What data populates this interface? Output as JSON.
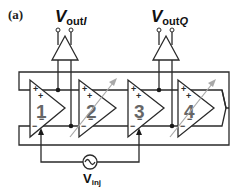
{
  "panel_label": "(a)",
  "outputs": {
    "i": {
      "main": "V",
      "sub": "out",
      "sub_italic": "I"
    },
    "q": {
      "main": "V",
      "sub": "out",
      "sub_italic": "Q"
    }
  },
  "amplifiers": [
    {
      "label": "1",
      "tunable": false
    },
    {
      "label": "2",
      "tunable": true
    },
    {
      "label": "3",
      "tunable": false
    },
    {
      "label": "4",
      "tunable": true
    }
  ],
  "signs": {
    "plus": "+",
    "minus": "−"
  },
  "source": {
    "main": "V",
    "sub": "inj"
  },
  "colors": {
    "wire": "#2a2a2a",
    "tuning_arrow": "#a8a8a8",
    "amp_number": "#666666"
  }
}
